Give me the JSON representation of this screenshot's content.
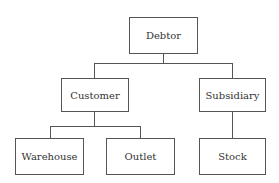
{
  "diagram": {
    "type": "hierarchy-tree",
    "nodes": {
      "debtor": "Debtor",
      "customer": "Customer",
      "subsidiary": "Subsidiary",
      "warehouse": "Warehouse",
      "outlet": "Outlet",
      "stock": "Stock"
    },
    "edges": [
      [
        "Debtor",
        "Customer"
      ],
      [
        "Debtor",
        "Subsidiary"
      ],
      [
        "Customer",
        "Warehouse"
      ],
      [
        "Customer",
        "Outlet"
      ],
      [
        "Subsidiary",
        "Stock"
      ]
    ],
    "colors": {
      "stroke": "#555555",
      "text": "#333333",
      "background": "#ffffff"
    }
  }
}
